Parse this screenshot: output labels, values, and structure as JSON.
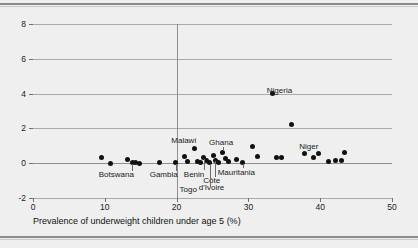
{
  "chart_data": {
    "type": "scatter",
    "title": "",
    "xlabel": "Prevalence of underweight children under age 5 (%)",
    "ylabel": "",
    "xlim": [
      0,
      50
    ],
    "ylim": [
      -2,
      8
    ],
    "xticks": [
      0,
      10,
      20,
      30,
      40,
      50
    ],
    "yticks": [
      -2,
      0,
      2,
      4,
      6,
      8
    ],
    "grid": "horizontal",
    "legend": "none",
    "reference_lines": [
      {
        "axis": "x",
        "value": 20
      },
      {
        "axis": "y",
        "value": 0
      }
    ],
    "points": [
      {
        "x": 9.6,
        "y": 0.3,
        "label": ""
      },
      {
        "x": 10.8,
        "y": 0.0,
        "label": ""
      },
      {
        "x": 13.2,
        "y": 0.22,
        "label": ""
      },
      {
        "x": 13.8,
        "y": 0.05,
        "label": "Botswana"
      },
      {
        "x": 14.3,
        "y": 0.02,
        "label": ""
      },
      {
        "x": 14.9,
        "y": 0.0,
        "label": ""
      },
      {
        "x": 17.6,
        "y": 0.05,
        "label": ""
      },
      {
        "x": 19.9,
        "y": 0.02,
        "label": "Gambia"
      },
      {
        "x": 21.1,
        "y": 0.38,
        "label": ""
      },
      {
        "x": 21.5,
        "y": 0.08,
        "label": ""
      },
      {
        "x": 22.5,
        "y": 0.85,
        "label": "Malawi"
      },
      {
        "x": 22.9,
        "y": 0.12,
        "label": ""
      },
      {
        "x": 23.3,
        "y": 0.04,
        "label": ""
      },
      {
        "x": 23.8,
        "y": 0.3,
        "label": "Benin"
      },
      {
        "x": 24.1,
        "y": 0.15,
        "label": ""
      },
      {
        "x": 24.6,
        "y": 0.02,
        "label": "Togo"
      },
      {
        "x": 25.1,
        "y": 0.45,
        "label": ""
      },
      {
        "x": 25.4,
        "y": 0.18,
        "label": "Côte d'Ivoire"
      },
      {
        "x": 25.9,
        "y": 0.05,
        "label": ""
      },
      {
        "x": 26.4,
        "y": 0.6,
        "label": "Ghana"
      },
      {
        "x": 26.8,
        "y": 0.25,
        "label": ""
      },
      {
        "x": 27.2,
        "y": 0.1,
        "label": ""
      },
      {
        "x": 28.3,
        "y": 0.2,
        "label": ""
      },
      {
        "x": 29.2,
        "y": 0.05,
        "label": "Mauritania"
      },
      {
        "x": 30.6,
        "y": 0.95,
        "label": ""
      },
      {
        "x": 31.2,
        "y": 0.4,
        "label": ""
      },
      {
        "x": 33.4,
        "y": 4.0,
        "label": "Nigeria"
      },
      {
        "x": 33.9,
        "y": 0.35,
        "label": ""
      },
      {
        "x": 34.6,
        "y": 0.35,
        "label": ""
      },
      {
        "x": 36.0,
        "y": 2.2,
        "label": ""
      },
      {
        "x": 37.8,
        "y": 0.55,
        "label": ""
      },
      {
        "x": 39.0,
        "y": 0.35,
        "label": ""
      },
      {
        "x": 39.8,
        "y": 0.55,
        "label": "Niger"
      },
      {
        "x": 41.1,
        "y": 0.12,
        "label": ""
      },
      {
        "x": 42.2,
        "y": 0.18,
        "label": ""
      },
      {
        "x": 42.9,
        "y": 0.18,
        "label": ""
      },
      {
        "x": 43.4,
        "y": 0.6,
        "label": ""
      }
    ],
    "annotations": [
      {
        "text": "Nigeria",
        "x": 34.3,
        "y": 4.15
      },
      {
        "text": "Niger",
        "x": 38.4,
        "y": 0.95
      },
      {
        "text": "Malawi",
        "x": 21.0,
        "y": 1.25
      },
      {
        "text": "Ghana",
        "x": 26.2,
        "y": 1.15
      },
      {
        "text": "Botswana",
        "x": 11.6,
        "y": -0.7
      },
      {
        "text": "Gambia",
        "x": 18.2,
        "y": -0.7
      },
      {
        "text": "Benin",
        "x": 22.4,
        "y": -0.7
      },
      {
        "text": "Mauritania",
        "x": 28.3,
        "y": -0.55
      },
      {
        "text": "Côte",
        "x": 24.9,
        "y": -1.05
      },
      {
        "text": "d'Ivoire",
        "x": 24.9,
        "y": -1.45
      },
      {
        "text": "Togo",
        "x": 21.6,
        "y": -1.55
      }
    ]
  }
}
